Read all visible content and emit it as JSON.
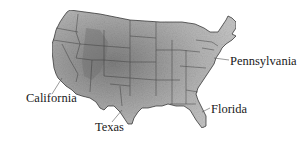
{
  "map": {
    "region": "Contiguous United States",
    "style": "grayscale shaded relief with state borders",
    "colors": {
      "background": "#ffffff",
      "land_light": "#c8c8c8",
      "land_mid": "#a6a6a6",
      "land_dark": "#7e7e7e",
      "border": "#3a3a3a",
      "label_text": "#1a1a1a",
      "leader_line": "#555555"
    },
    "labels": [
      {
        "id": "pennsylvania",
        "text": "Pennsylvania",
        "x": 230,
        "y": 55
      },
      {
        "id": "california",
        "text": "California",
        "x": 26,
        "y": 92
      },
      {
        "id": "florida",
        "text": "Florida",
        "x": 211,
        "y": 103
      },
      {
        "id": "texas",
        "text": "Texas",
        "x": 95,
        "y": 121
      }
    ]
  }
}
